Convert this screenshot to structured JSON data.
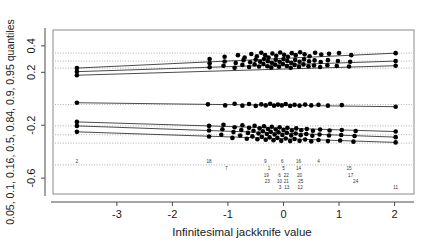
{
  "chart_data": {
    "type": "scatter",
    "title": "",
    "xlabel": "Infinitesimal  jackknife value",
    "ylabel": "0.05, 0.1, 0.16, 0.5, 0.84, 0.9, 0.95 quantiles",
    "xlim": [
      -4.15,
      2.35
    ],
    "ylim": [
      -0.72,
      0.52
    ],
    "xticks": [
      -3,
      -2,
      -1,
      0,
      1,
      2
    ],
    "xticklabels": [
      "-3",
      "-2",
      "-1",
      "0",
      "1",
      "2"
    ],
    "yticks": [
      0.4,
      0.2,
      -0.2,
      -0.6
    ],
    "yticklabels": [
      "0.4",
      "0.2",
      "-0.2",
      "-0.6"
    ],
    "grid": false,
    "reference_lines": {
      "style": "dotted",
      "color": "#999999",
      "values": [
        0.345,
        0.285,
        0.232,
        -0.043,
        -0.205,
        -0.272,
        -0.335,
        -0.5
      ]
    },
    "quantile_curves": [
      {
        "name": "0.95",
        "x0": -3.72,
        "y0": 0.232,
        "x1": 2.02,
        "y1": 0.345
      },
      {
        "name": "0.9",
        "x0": -3.72,
        "y0": 0.205,
        "x1": 2.02,
        "y1": 0.285
      },
      {
        "name": "0.84",
        "x0": -3.72,
        "y0": 0.178,
        "x1": 2.02,
        "y1": 0.25
      },
      {
        "name": "0.5",
        "x0": -3.72,
        "y0": -0.03,
        "x1": 2.02,
        "y1": -0.06
      },
      {
        "name": "0.16",
        "x0": -3.72,
        "y0": -0.175,
        "x1": 2.02,
        "y1": -0.248
      },
      {
        "name": "0.1",
        "x0": -3.72,
        "y0": -0.205,
        "x1": 2.02,
        "y1": -0.29
      },
      {
        "name": "0.05",
        "x0": -3.72,
        "y0": -0.25,
        "x1": 2.02,
        "y1": -0.33
      }
    ],
    "point_color": "#000000",
    "point_size": 2.3,
    "series": [
      {
        "name": "0.95 quantile points",
        "x": [
          -3.72,
          -1.33,
          -1.06,
          -0.82,
          -0.7,
          -0.58,
          -0.48,
          -0.4,
          -0.33,
          -0.27,
          -0.2,
          -0.13,
          -0.06,
          0.01,
          0.08,
          0.15,
          0.22,
          0.3,
          0.38,
          0.47,
          0.57,
          0.68,
          0.82,
          1.0,
          1.22,
          2.02
        ],
        "y": [
          0.232,
          0.3,
          0.318,
          0.33,
          0.312,
          0.338,
          0.322,
          0.348,
          0.33,
          0.312,
          0.342,
          0.325,
          0.35,
          0.332,
          0.318,
          0.345,
          0.33,
          0.352,
          0.336,
          0.322,
          0.348,
          0.334,
          0.34,
          0.346,
          0.33,
          0.345
        ]
      },
      {
        "name": "0.9 quantile points",
        "x": [
          -3.72,
          -1.33,
          -1.06,
          -0.86,
          -0.72,
          -0.6,
          -0.5,
          -0.42,
          -0.35,
          -0.28,
          -0.21,
          -0.14,
          -0.07,
          0.0,
          0.07,
          0.14,
          0.21,
          0.29,
          0.37,
          0.46,
          0.56,
          0.67,
          0.8,
          0.98,
          1.2,
          2.02
        ],
        "y": [
          0.205,
          0.268,
          0.282,
          0.27,
          0.292,
          0.276,
          0.296,
          0.28,
          0.3,
          0.284,
          0.272,
          0.296,
          0.28,
          0.3,
          0.286,
          0.272,
          0.294,
          0.28,
          0.298,
          0.284,
          0.29,
          0.278,
          0.292,
          0.286,
          0.28,
          0.285
        ]
      },
      {
        "name": "0.84 quantile points",
        "x": [
          -3.72,
          -1.33,
          -1.08,
          -0.88,
          -0.74,
          -0.62,
          -0.52,
          -0.44,
          -0.36,
          -0.29,
          -0.22,
          -0.15,
          -0.08,
          -0.01,
          0.06,
          0.13,
          0.2,
          0.28,
          0.36,
          0.45,
          0.55,
          0.66,
          0.79,
          0.96,
          1.18,
          2.02
        ],
        "y": [
          0.178,
          0.238,
          0.25,
          0.234,
          0.256,
          0.24,
          0.26,
          0.244,
          0.262,
          0.246,
          0.236,
          0.258,
          0.242,
          0.262,
          0.248,
          0.234,
          0.256,
          0.242,
          0.26,
          0.246,
          0.252,
          0.24,
          0.254,
          0.248,
          0.244,
          0.25
        ]
      },
      {
        "name": "0.5 quantile points",
        "x": [
          -3.72,
          -1.36,
          -1.05,
          -0.88,
          -0.74,
          -0.62,
          -0.5,
          -0.4,
          -0.32,
          -0.24,
          -0.17,
          -0.1,
          -0.03,
          0.04,
          0.12,
          0.2,
          0.29,
          0.39,
          0.5,
          0.63,
          0.8,
          1.05,
          2.02
        ],
        "y": [
          -0.03,
          -0.042,
          -0.05,
          -0.038,
          -0.052,
          -0.04,
          -0.054,
          -0.042,
          -0.05,
          -0.038,
          -0.052,
          -0.044,
          -0.05,
          -0.04,
          -0.054,
          -0.046,
          -0.052,
          -0.044,
          -0.05,
          -0.046,
          -0.052,
          -0.048,
          -0.06
        ]
      },
      {
        "name": "0.16 quantile points",
        "x": [
          -3.72,
          -1.34,
          -1.08,
          -0.88,
          -0.74,
          -0.62,
          -0.52,
          -0.43,
          -0.35,
          -0.28,
          -0.21,
          -0.14,
          -0.07,
          0.0,
          0.07,
          0.15,
          0.23,
          0.32,
          0.42,
          0.53,
          0.66,
          0.83,
          1.05,
          1.3,
          2.02
        ],
        "y": [
          -0.175,
          -0.205,
          -0.196,
          -0.215,
          -0.2,
          -0.22,
          -0.204,
          -0.224,
          -0.208,
          -0.228,
          -0.212,
          -0.232,
          -0.216,
          -0.236,
          -0.22,
          -0.24,
          -0.224,
          -0.238,
          -0.228,
          -0.242,
          -0.232,
          -0.24,
          -0.236,
          -0.244,
          -0.248
        ]
      },
      {
        "name": "0.1 quantile points",
        "x": [
          -3.72,
          -1.34,
          -1.1,
          -0.9,
          -0.76,
          -0.64,
          -0.54,
          -0.45,
          -0.37,
          -0.3,
          -0.23,
          -0.16,
          -0.09,
          -0.02,
          0.06,
          0.14,
          0.22,
          0.31,
          0.41,
          0.52,
          0.65,
          0.82,
          1.04,
          1.28,
          2.02
        ],
        "y": [
          -0.205,
          -0.24,
          -0.23,
          -0.252,
          -0.236,
          -0.258,
          -0.242,
          -0.262,
          -0.246,
          -0.266,
          -0.25,
          -0.27,
          -0.254,
          -0.274,
          -0.258,
          -0.278,
          -0.262,
          -0.276,
          -0.266,
          -0.28,
          -0.27,
          -0.278,
          -0.274,
          -0.282,
          -0.29
        ]
      },
      {
        "name": "0.05 quantile points",
        "x": [
          -3.72,
          -1.34,
          -1.12,
          -0.92,
          -0.78,
          -0.66,
          -0.56,
          -0.47,
          -0.39,
          -0.32,
          -0.25,
          -0.18,
          -0.11,
          -0.04,
          0.04,
          0.12,
          0.2,
          0.29,
          0.39,
          0.5,
          0.63,
          0.8,
          1.02,
          1.26,
          2.02
        ],
        "y": [
          -0.25,
          -0.285,
          -0.272,
          -0.296,
          -0.278,
          -0.302,
          -0.284,
          -0.306,
          -0.288,
          -0.31,
          -0.292,
          -0.314,
          -0.296,
          -0.318,
          -0.3,
          -0.32,
          -0.304,
          -0.318,
          -0.308,
          -0.322,
          -0.312,
          -0.32,
          -0.316,
          -0.324,
          -0.33
        ]
      }
    ],
    "point_labels": [
      {
        "text": "2",
        "x": -3.72,
        "row": 1
      },
      {
        "text": "18",
        "x": -1.34,
        "row": 1
      },
      {
        "text": "7",
        "x": -1.03,
        "row": 2
      },
      {
        "text": "9",
        "x": -0.33,
        "row": 1
      },
      {
        "text": "1",
        "x": -0.26,
        "row": 2
      },
      {
        "text": "19",
        "x": -0.31,
        "row": 3
      },
      {
        "text": "23",
        "x": -0.29,
        "row": 4
      },
      {
        "text": "6",
        "x": -0.02,
        "row": 1
      },
      {
        "text": "5",
        "x": 0.0,
        "row": 2
      },
      {
        "text": "6",
        "x": -0.07,
        "row": 3
      },
      {
        "text": "22",
        "x": 0.05,
        "row": 3
      },
      {
        "text": "10",
        "x": -0.07,
        "row": 4
      },
      {
        "text": "21",
        "x": 0.05,
        "row": 4
      },
      {
        "text": "3",
        "x": -0.06,
        "row": 5
      },
      {
        "text": "13",
        "x": 0.06,
        "row": 5
      },
      {
        "text": "16",
        "x": 0.27,
        "row": 1
      },
      {
        "text": "14",
        "x": 0.27,
        "row": 2
      },
      {
        "text": "20",
        "x": 0.29,
        "row": 3
      },
      {
        "text": "25",
        "x": 0.31,
        "row": 4
      },
      {
        "text": "12",
        "x": 0.3,
        "row": 5
      },
      {
        "text": "4",
        "x": 0.63,
        "row": 1
      },
      {
        "text": "15",
        "x": 1.18,
        "row": 2
      },
      {
        "text": "17",
        "x": 1.21,
        "row": 3
      },
      {
        "text": "24",
        "x": 1.3,
        "row": 4
      },
      {
        "text": "11",
        "x": 2.02,
        "row": 5
      }
    ]
  }
}
